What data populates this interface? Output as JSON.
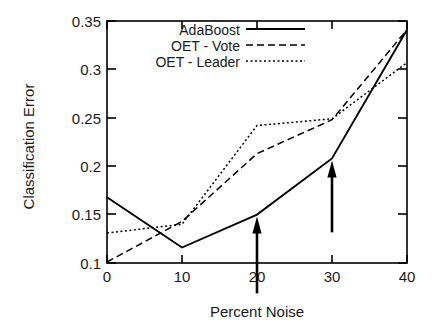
{
  "chart_data": {
    "type": "line",
    "title": "",
    "xlabel": "Percent Noise",
    "ylabel": "Classification Error",
    "x": [
      0,
      10,
      20,
      30,
      40
    ],
    "xlim": [
      0,
      40
    ],
    "ylim": [
      0.1,
      0.35
    ],
    "xticks": [
      "0",
      "10",
      "20",
      "30",
      "40"
    ],
    "yticks": [
      "0.1",
      "0.15",
      "0.2",
      "0.25",
      "0.3",
      "0.35"
    ],
    "grid": false,
    "legend_position": "top-center-inside",
    "series": [
      {
        "name": "AdaBoost",
        "style": "solid",
        "color": "#000000",
        "values": [
          0.168,
          0.116,
          0.15,
          0.208,
          0.341
        ]
      },
      {
        "name": "OET - Vote",
        "style": "dashed",
        "color": "#000000",
        "values": [
          0.101,
          0.143,
          0.213,
          0.248,
          0.341
        ]
      },
      {
        "name": "OET - Leader",
        "style": "dotted",
        "color": "#000000",
        "values": [
          0.131,
          0.14,
          0.242,
          0.249,
          0.307
        ]
      }
    ],
    "annotations": [
      {
        "type": "arrow",
        "direction": "up",
        "x": 20,
        "y_tip": 0.15,
        "y_tail": 0.112
      },
      {
        "type": "arrow",
        "direction": "up",
        "x": 30,
        "y_tip": 0.208,
        "y_tail": 0.175
      }
    ]
  },
  "legend": {
    "entries": [
      {
        "label": "AdaBoost"
      },
      {
        "label": "OET - Vote"
      },
      {
        "label": "OET - Leader"
      }
    ]
  },
  "axes": {
    "y_title": "Classification Error",
    "x_title": "Percent Noise",
    "y_tick_labels": [
      "0.35",
      "0.3",
      "0.25",
      "0.2",
      "0.15",
      "0.1"
    ],
    "x_tick_labels": [
      "0",
      "10",
      "20",
      "30",
      "40"
    ]
  },
  "colors": {
    "ink": "#000000",
    "background": "#ffffff"
  }
}
